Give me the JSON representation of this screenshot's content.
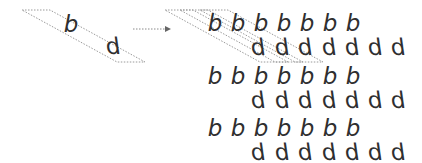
{
  "diagram": {
    "source": {
      "letters": [
        {
          "char": "b",
          "x": 71,
          "y": 24
        },
        {
          "char": "d",
          "x": 113,
          "y": 46
        }
      ],
      "parallelogram": {
        "points": "22,10 50,10 145,62 117,62",
        "stroke": "#9a9a9a"
      }
    },
    "arrow": {
      "x1": 133,
      "y1": 29,
      "x2": 171,
      "y2": 29,
      "color": "#8a8a8a"
    },
    "grid": {
      "b_rows_y": [
        23,
        76,
        128
      ],
      "d_rows_y": [
        47,
        100,
        152
      ],
      "b_x": [
        215,
        238,
        261,
        284,
        307,
        330,
        353
      ],
      "d_x": [
        258,
        282,
        305,
        329,
        352,
        375,
        398
      ],
      "b_char": "b",
      "d_char": "d"
    },
    "overlay_parallelograms": [
      {
        "points": "165,10 193,10 288,62 260,62"
      },
      {
        "points": "180,10 208,10 303,62 275,62"
      },
      {
        "points": "200,10 228,10 323,62 295,62"
      }
    ],
    "colors": {
      "text": "#2f2f2f",
      "dotted": "#9a9a9a"
    }
  }
}
